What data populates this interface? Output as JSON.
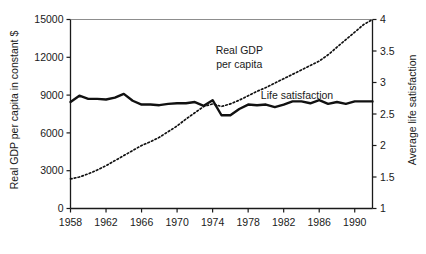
{
  "chart_data": {
    "type": "line",
    "title": "",
    "subtitle": "",
    "xlabel": "",
    "ylabel": "Real GDP per capita in constant $",
    "y2label": "Average life satisfaction",
    "grid": false,
    "legend_position": "inline-annotation",
    "xlim": [
      1958,
      1992
    ],
    "ylim": [
      0,
      15000
    ],
    "y2lim": [
      1,
      4
    ],
    "x_ticks": [
      1958,
      1962,
      1966,
      1970,
      1974,
      1978,
      1982,
      1986,
      1990
    ],
    "x_tick_labels": [
      "1958",
      "1962",
      "1966",
      "1970",
      "1974",
      "1978",
      "1982",
      "1986",
      "1990"
    ],
    "y_ticks": [
      0,
      3000,
      6000,
      9000,
      12000,
      15000
    ],
    "y_tick_labels": [
      "0",
      "3000",
      "6000",
      "9000",
      "12000",
      "15000"
    ],
    "y2_ticks": [
      1,
      1.5,
      2,
      2.5,
      3,
      3.5,
      4
    ],
    "y2_tick_labels": [
      "1",
      "1.5",
      "2",
      "2.5",
      "3",
      "3.5",
      "4"
    ],
    "annotations": [
      {
        "text_line1": "Real GDP",
        "text_line2": "per capita",
        "x": 1977.0,
        "y_px": 54
      },
      {
        "text": "Life satisfaction",
        "x": 1983.5,
        "y_px": 99
      }
    ],
    "series": [
      {
        "name": "Real GDP per capita",
        "axis": "right",
        "style": "dotted",
        "color": "#111111",
        "x": [
          1958,
          1959,
          1960,
          1961,
          1962,
          1963,
          1964,
          1965,
          1966,
          1967,
          1968,
          1969,
          1970,
          1971,
          1972,
          1973,
          1974,
          1975,
          1976,
          1977,
          1978,
          1979,
          1980,
          1981,
          1982,
          1983,
          1984,
          1985,
          1986,
          1987,
          1988,
          1989,
          1990,
          1991,
          1992
        ],
        "values": [
          1.47,
          1.5,
          1.55,
          1.61,
          1.68,
          1.76,
          1.84,
          1.92,
          2.0,
          2.06,
          2.13,
          2.22,
          2.31,
          2.42,
          2.52,
          2.62,
          2.66,
          2.62,
          2.66,
          2.72,
          2.79,
          2.86,
          2.92,
          2.99,
          3.06,
          3.13,
          3.2,
          3.27,
          3.34,
          3.44,
          3.56,
          3.68,
          3.8,
          3.92,
          4.0
        ],
        "values_left_axis": [
          2350,
          2500,
          2750,
          3050,
          3400,
          3800,
          4200,
          4600,
          5000,
          5300,
          5650,
          6100,
          6550,
          7100,
          7600,
          8100,
          8300,
          8100,
          8300,
          8600,
          8950,
          9300,
          9600,
          9950,
          10300,
          10650,
          11000,
          11350,
          11700,
          12200,
          12800,
          13400,
          14000,
          14600,
          15000
        ]
      },
      {
        "name": "Life satisfaction",
        "axis": "left",
        "style": "solid",
        "color": "#111111",
        "x": [
          1958,
          1959,
          1960,
          1961,
          1962,
          1963,
          1964,
          1965,
          1966,
          1967,
          1968,
          1969,
          1970,
          1971,
          1972,
          1973,
          1974,
          1975,
          1976,
          1977,
          1978,
          1979,
          1980,
          1981,
          1982,
          1983,
          1984,
          1985,
          1986,
          1987,
          1988,
          1989,
          1990,
          1991,
          1992
        ],
        "values": [
          2.69,
          2.77,
          2.73,
          2.73,
          2.72,
          2.75,
          2.8,
          2.71,
          2.66,
          2.66,
          2.65,
          2.67,
          2.68,
          2.68,
          2.69,
          2.64,
          2.71,
          2.55,
          2.55,
          2.62,
          2.66,
          2.65,
          2.66,
          2.63,
          2.66,
          2.7,
          2.7,
          2.68,
          2.72,
          2.67,
          2.69,
          2.67,
          2.7,
          2.7,
          2.7
        ],
        "values_left_axis": [
          8450,
          8950,
          8700,
          8700,
          8650,
          8800,
          9100,
          8550,
          8250,
          8250,
          8200,
          8300,
          8350,
          8350,
          8450,
          8150,
          8600,
          7400,
          7400,
          7900,
          8250,
          8200,
          8250,
          8050,
          8250,
          8500,
          8500,
          8350,
          8600,
          8300,
          8450,
          8300,
          8500,
          8500,
          8500
        ]
      }
    ]
  },
  "axes": {
    "left_label": "Real GDP per capita in constant $",
    "right_label": "Average life satisfaction"
  }
}
